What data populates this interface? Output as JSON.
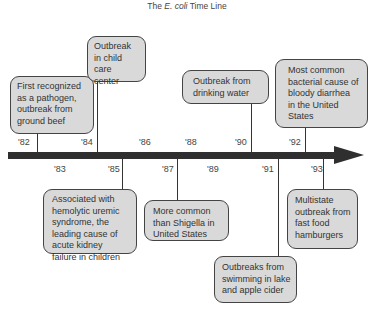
{
  "title": {
    "prefix": "The ",
    "italic": "E. coli",
    "suffix": " Time Line"
  },
  "timeline": {
    "arrow_color": "#2f2f2f",
    "box_fill": "#d9d9d9",
    "years_above": [
      "'82",
      "'84",
      "'86",
      "'88",
      "'90",
      "'92"
    ],
    "years_below": [
      "'83",
      "'85",
      "'87",
      "'89",
      "'91",
      "'93"
    ]
  },
  "events": [
    {
      "year": "'82",
      "text": "First recognized as a pathogen, outbreak from ground beef"
    },
    {
      "year": "'84",
      "text": "Outbreak in child care center"
    },
    {
      "year": "'90",
      "text": "Outbreak from drinking water"
    },
    {
      "year": "'92",
      "text": "Most common bacterial cause of bloody diarrhea in the United States"
    },
    {
      "year": "'85",
      "text": "Associated with hemolytic uremic syndrome, the leading cause of acute kidney failure in children"
    },
    {
      "year": "'87",
      "text": "More common than Shigella in United States"
    },
    {
      "year": "'91",
      "text": "Outbreaks from swimming in lake and apple cider"
    },
    {
      "year": "'93",
      "text": "Multistate outbreak from fast food hamburgers"
    }
  ]
}
